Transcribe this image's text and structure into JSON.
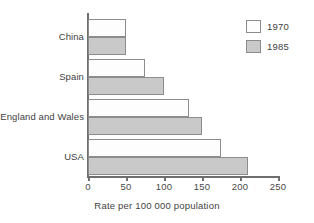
{
  "chart_data": {
    "type": "bar",
    "orientation": "horizontal",
    "title": "",
    "xlabel": "Rate per 100 000 population",
    "ylabel": "",
    "xlim": [
      0,
      250
    ],
    "xticks": [
      0,
      50,
      100,
      150,
      200,
      250
    ],
    "xtick_labels": [
      "0",
      "50",
      "100",
      "150",
      "200",
      "250"
    ],
    "grid": false,
    "legend_position": "top-right",
    "categories": [
      "China",
      "Spain",
      "England and Wales",
      "USA"
    ],
    "series": [
      {
        "name": "1970",
        "color": "#fdfdfd",
        "values": [
          50,
          75,
          133,
          175
        ]
      },
      {
        "name": "1985",
        "color": "#c9c9c9",
        "values": [
          50,
          100,
          150,
          210
        ]
      }
    ]
  },
  "legend": {
    "items": [
      {
        "label": "1970",
        "swatch": "white-swatch"
      },
      {
        "label": "1985",
        "swatch": "gray-swatch"
      }
    ]
  },
  "colors": {
    "bar_1970": "#fdfdfd",
    "bar_1985": "#c9c9c9",
    "bar_border": "#8c8c8c",
    "axis": "#6e6e6e",
    "text": "#3f3f3f",
    "background": "#ffffff"
  }
}
